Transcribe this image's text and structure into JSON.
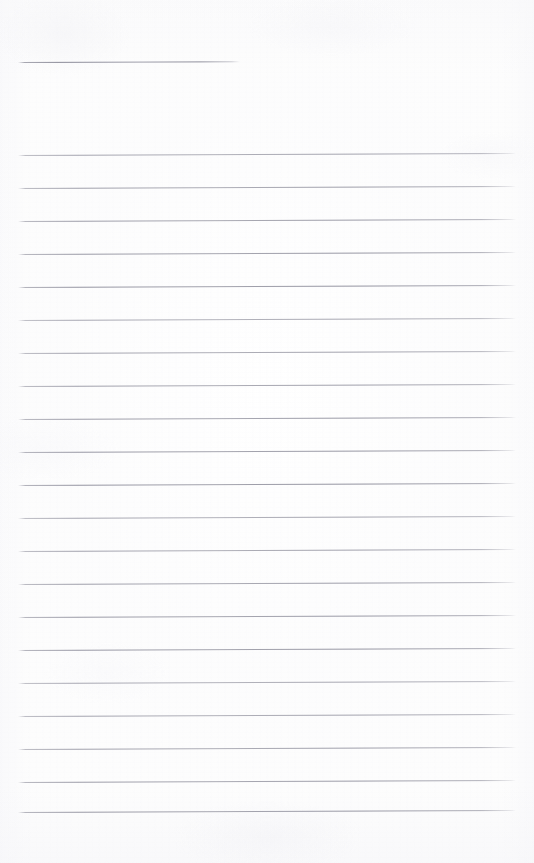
{
  "document": {
    "type": "lined-notepad-page",
    "title_line_text": "",
    "body_text": "",
    "page_width": 534,
    "page_height": 863
  },
  "appearance": {
    "paper_color": "#fdfdfd",
    "rule_color": "#8e8e9a",
    "edge_tint": "#eeeef2"
  },
  "layout": {
    "rule_left_x": 18,
    "rule_right_x": 516,
    "rule_thickness": 1,
    "rule_spacing": 33.2,
    "first_rule_y": 155,
    "last_rule_y": 812,
    "slant_degrees": -0.22
  },
  "header_rule": {
    "name": "title-rule",
    "y": 62,
    "x_start": 18,
    "x_end": 240,
    "width": 222
  },
  "rules": [
    {
      "index": 1,
      "y": 155
    },
    {
      "index": 2,
      "y": 188
    },
    {
      "index": 3,
      "y": 221
    },
    {
      "index": 4,
      "y": 254
    },
    {
      "index": 5,
      "y": 287
    },
    {
      "index": 6,
      "y": 320
    },
    {
      "index": 7,
      "y": 353
    },
    {
      "index": 8,
      "y": 386
    },
    {
      "index": 9,
      "y": 419
    },
    {
      "index": 10,
      "y": 452
    },
    {
      "index": 11,
      "y": 485
    },
    {
      "index": 12,
      "y": 518
    },
    {
      "index": 13,
      "y": 551
    },
    {
      "index": 14,
      "y": 584
    },
    {
      "index": 15,
      "y": 617
    },
    {
      "index": 16,
      "y": 650
    },
    {
      "index": 17,
      "y": 683
    },
    {
      "index": 18,
      "y": 716
    },
    {
      "index": 19,
      "y": 749
    },
    {
      "index": 20,
      "y": 782
    },
    {
      "index": 21,
      "y": 812
    }
  ]
}
